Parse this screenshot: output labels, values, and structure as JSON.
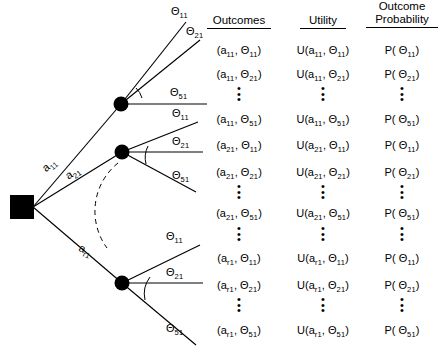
{
  "figure": {
    "type": "decision-tree",
    "decision_node": {
      "shape": "square",
      "label": ""
    },
    "chance_nodes": [
      {
        "id": "chance-node-1",
        "shape": "filled-circle"
      },
      {
        "id": "chance-node-2",
        "shape": "filled-circle"
      },
      {
        "id": "chance-node-3",
        "shape": "filled-circle"
      }
    ],
    "action_branches": [
      {
        "id": "branch-a11",
        "base": "a",
        "sub": "11"
      },
      {
        "id": "branch-a21",
        "base": "a",
        "sub": "21"
      },
      {
        "id": "branch-ar1",
        "base": "a",
        "sub": "r1"
      }
    ],
    "state_branches": [
      {
        "base": "Θ",
        "sub": "11"
      },
      {
        "base": "Θ",
        "sub": "21"
      },
      {
        "base": "Θ",
        "sub": "51"
      }
    ]
  },
  "columns": {
    "outcomes": {
      "header": "Outcomes",
      "header_line2": ""
    },
    "utility": {
      "header": "Utility",
      "header_line2": ""
    },
    "probability": {
      "header": "Outcome",
      "header_line2": "Probability"
    }
  },
  "rows": [
    {
      "outcome_a": "11",
      "outcome_t": "11"
    },
    {
      "outcome_a": "11",
      "outcome_t": "21"
    },
    {
      "outcome_a": "11",
      "outcome_t": "51"
    },
    {
      "outcome_a": "21",
      "outcome_t": "11"
    },
    {
      "outcome_a": "21",
      "outcome_t": "21"
    },
    {
      "outcome_a": "21",
      "outcome_t": "51"
    },
    {
      "outcome_a": "r1",
      "outcome_t": "11"
    },
    {
      "outcome_a": "r1",
      "outcome_t": "21"
    },
    {
      "outcome_a": "r1",
      "outcome_t": "51"
    }
  ],
  "symbols": {
    "theta": "Θ",
    "utility_prefix": "U",
    "probability_prefix": "P",
    "open_paren": "(",
    "close_paren": ")",
    "comma": ",",
    "vertical_ellipsis": "•"
  },
  "style": {
    "ink": "#000000",
    "background": "#ffffff"
  }
}
